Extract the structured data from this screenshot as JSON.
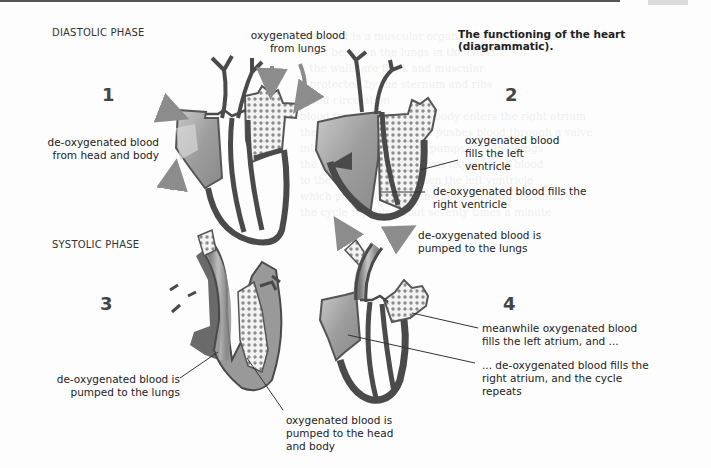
{
  "figure": {
    "caption": "The functioning of the heart (diagrammatic).",
    "phases": {
      "diastolic": "DIASTOLIC PHASE",
      "systolic": "SYSTOLIC PHASE"
    },
    "panels": [
      {
        "number": "1",
        "labels": [
          {
            "id": "oxy-from-lungs",
            "text": "oxygenated blood\nfrom lungs"
          },
          {
            "id": "deoxy-from-body",
            "text": "de-oxygenated blood\nfrom head and body"
          }
        ]
      },
      {
        "number": "2",
        "labels": [
          {
            "id": "oxy-left-ventricle",
            "text": "oxygenated blood\nfills the left\nventricle"
          },
          {
            "id": "deoxy-right-ventricle",
            "text": "de-oxygenated blood fills the\nright ventricle"
          }
        ]
      },
      {
        "number": "3",
        "labels": [
          {
            "id": "deoxy-to-lungs-3",
            "text": "de-oxygenated blood is\npumped to the lungs"
          },
          {
            "id": "oxy-to-body",
            "text": "oxygenated blood is\npumped to the head\nand body"
          }
        ]
      },
      {
        "number": "4",
        "labels": [
          {
            "id": "deoxy-to-lungs-4",
            "text": "de-oxygenated blood is\npumped to the lungs"
          },
          {
            "id": "oxy-left-atrium",
            "text": "meanwhile oxygenated blood\nfills the left atrium, and ..."
          },
          {
            "id": "deoxy-right-atrium",
            "text": "... de-oxygenated blood fills the\nright atrium, and the cycle\nrepeats"
          }
        ]
      }
    ],
    "colors": {
      "outline": "#4a4a4a",
      "deoxy_fill": "#9a9a9a",
      "oxy_fill": "#f2f2f2",
      "oxy_dots": "#8a8a8a",
      "arrow": "#8c8c8c",
      "leader": "#333333"
    }
  },
  "background_text": "the heart is a muscular organ about the size of a fist\n• lies between the lungs in the chest\n• the walls are thick and muscular\n• protected by the sternum and ribs\nblood circulation\nblood from the head and body enters the right atrium\nthe atrium contracts and pushes blood through a valve\ninto the ventricle which pumps it to the lungs\nthe pulmonary vein returns oxygenated blood\nto the left atrium and then the left ventricle\nwhich pumps it round the body through the aorta\nthe cycle repeats about seventy times a minute"
}
